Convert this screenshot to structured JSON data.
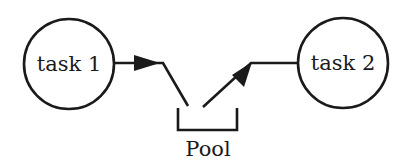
{
  "diagram": {
    "nodes": [
      {
        "id": "task1",
        "label": "task 1",
        "shape": "circle"
      },
      {
        "id": "task2",
        "label": "task 2",
        "shape": "circle"
      }
    ],
    "pool": {
      "label": "Pool",
      "shape": "bracket"
    },
    "edges": [
      {
        "from": "task 1",
        "to": "Pool",
        "arrow": "arrowhead-into-pool-direction"
      },
      {
        "from": "Pool",
        "to": "task 2",
        "arrow": "arrowhead-out-of-pool"
      }
    ],
    "colors": {
      "stroke": "#1a1a1a",
      "background": "#ffffff"
    }
  }
}
